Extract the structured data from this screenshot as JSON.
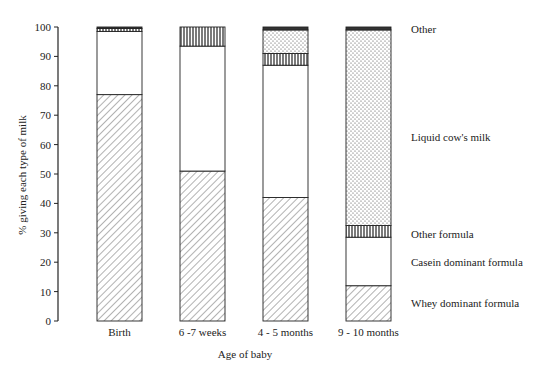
{
  "chart_data": {
    "type": "bar",
    "stacked": true,
    "title": "",
    "xlabel": "Age of baby",
    "ylabel": "% giving each type of milk",
    "ylim": [
      0,
      100
    ],
    "yticks": [
      0,
      10,
      20,
      30,
      40,
      50,
      60,
      70,
      80,
      90,
      100
    ],
    "grid": false,
    "legend_placement": "right",
    "categories": [
      "Birth",
      "6 -7 weeks",
      "4 - 5 months",
      "9 - 10 months"
    ],
    "series": [
      {
        "name": "Whey dominant formula",
        "pattern": "diagonal-hatch",
        "values": [
          77,
          51,
          42,
          12
        ]
      },
      {
        "name": "Casein dominant formula",
        "pattern": "blank",
        "values": [
          21.5,
          42.5,
          45,
          16.5
        ]
      },
      {
        "name": "Other formula",
        "pattern": "vertical-stripes",
        "values": [
          1,
          6.5,
          4,
          4
        ]
      },
      {
        "name": "Liquid cow's milk",
        "pattern": "dots",
        "values": [
          0,
          0,
          8,
          66.5
        ]
      },
      {
        "name": "Other",
        "pattern": "solid-dark",
        "values": [
          0.5,
          0,
          1,
          1
        ]
      }
    ],
    "legend_order_top_to_bottom": [
      "Other",
      "Liquid cow's milk",
      "Other formula",
      "Casein dominant formula",
      "Whey dominant formula"
    ]
  }
}
